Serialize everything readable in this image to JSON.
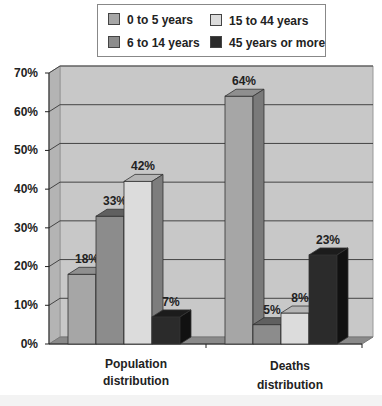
{
  "chart_data": {
    "type": "bar",
    "subtype": "3d-clustered-column",
    "title": "",
    "xlabel": "",
    "ylabel": "",
    "categories": [
      "Population distribution",
      "Deaths distribution"
    ],
    "category_lines": [
      [
        "Population",
        "distribution"
      ],
      [
        "Deaths",
        "distribution"
      ]
    ],
    "series": [
      {
        "name": "0 to 5 years",
        "values": [
          18,
          64
        ],
        "color": "#a6a6a6",
        "side": "#7a7a7a",
        "top": "#8f8f8f"
      },
      {
        "name": "6 to 14 years",
        "values": [
          33,
          5
        ],
        "color": "#8c8c8c",
        "side": "#6b6b6b",
        "top": "#606060"
      },
      {
        "name": "15 to 44 years",
        "values": [
          42,
          8
        ],
        "color": "#dcdcdc",
        "side": "#7d7d7d",
        "top": "#b5b5b5"
      },
      {
        "name": "45 years or more",
        "values": [
          7,
          23
        ],
        "color": "#2b2b2b",
        "side": "#111111",
        "top": "#1c1c1c"
      }
    ],
    "data_labels": [
      [
        "18%",
        "64%"
      ],
      [
        "33%",
        "5%"
      ],
      [
        "42%",
        "8%"
      ],
      [
        "7%",
        "23%"
      ]
    ],
    "y_ticks": [
      "0%",
      "10%",
      "20%",
      "30%",
      "40%",
      "50%",
      "60%",
      "70%"
    ],
    "ylim": [
      0,
      70
    ],
    "grid": true,
    "legend_position": "top",
    "wall_color": "#c8c8c8",
    "floor_color": "#8a8a8a"
  },
  "legend": {
    "items": [
      {
        "label": "0 to 5 years",
        "color": "#a6a6a6"
      },
      {
        "label": "15 to 44 years",
        "color": "#dcdcdc"
      },
      {
        "label": "6 to 14 years",
        "color": "#8c8c8c"
      },
      {
        "label": "45 years or more",
        "color": "#2b2b2b"
      }
    ]
  },
  "axis": {
    "y_ticks": [
      "70%",
      "60%",
      "50%",
      "40%",
      "30%",
      "20%",
      "10%",
      "0%"
    ]
  },
  "categories": {
    "population": {
      "line1": "Population",
      "line2": "distribution"
    },
    "deaths": {
      "line1": "Deaths",
      "line2": "distribution"
    }
  }
}
